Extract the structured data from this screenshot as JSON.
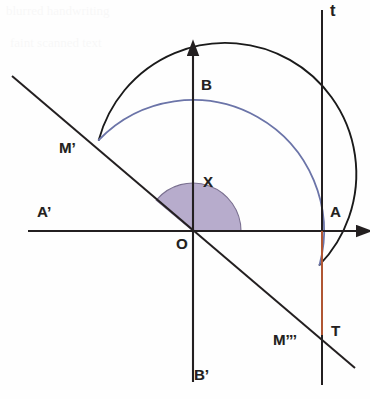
{
  "figure": {
    "kind": "geometry-diagram",
    "width": 370,
    "height": 399,
    "background_color": "#fefefe"
  },
  "colors": {
    "ink": "#231f20",
    "circle_lower_arc": "#1a1a1a",
    "circle_upper_arc": "#6b74a8",
    "angle_fill": "#b3a8c9",
    "angle_stroke": "#7a7090",
    "tangent_segment": "#e06a3a",
    "axis": "#231f20"
  },
  "geometry": {
    "origin": {
      "x": 193,
      "y": 231,
      "label": "O"
    },
    "circle": {
      "cx": 193,
      "cy": 231,
      "r": 131
    },
    "x_axis": {
      "x1": 28,
      "y1": 231,
      "x2": 362,
      "y2": 231,
      "arrow": "right"
    },
    "y_axis": {
      "x1": 193,
      "y1": 382,
      "x2": 193,
      "y2": 50,
      "arrow": "up"
    },
    "tangent_line": {
      "x": 322,
      "y1": 10,
      "y2": 385,
      "label": "t"
    },
    "secant_line": {
      "x1": 12,
      "y1": 76,
      "x2": 355,
      "y2": 368
    },
    "tangent_segment": {
      "x": 322,
      "y1": 231,
      "y2": 335
    },
    "angle_sector": {
      "start_deg": 0,
      "end_deg": 140,
      "radius": 48,
      "label": "X"
    }
  },
  "labels": {
    "tangent_line": "t",
    "top": "B",
    "upper_left_intersection": "M’",
    "angle": "X",
    "left": "A’",
    "right": "A",
    "origin": "O",
    "tangent_point": "T",
    "lower_right_intersection": "M’’’",
    "bottom": "B’"
  },
  "scan_artifacts": {
    "line_one": "blurred handwriting",
    "line_two": "faint scanned text"
  },
  "chart_data": {
    "type": "scatter",
    "xlabel": "",
    "ylabel": "",
    "xlim": [
      -1.26,
      1.29
    ],
    "ylim": [
      -1.29,
      1.38
    ],
    "grid": false,
    "legend_position": "none",
    "annotations": [
      {
        "text": "t",
        "role": "tangent-line-name"
      },
      {
        "text": "X",
        "role": "angle-name"
      }
    ],
    "points": [
      {
        "name": "O",
        "x": 0.0,
        "y": 0.0,
        "role": "center"
      },
      {
        "name": "A",
        "x": 1.0,
        "y": 0.0,
        "role": "circle-right"
      },
      {
        "name": "A’",
        "x": -1.0,
        "y": 0.0,
        "role": "circle-left"
      },
      {
        "name": "B",
        "x": 0.0,
        "y": 1.0,
        "role": "circle-top"
      },
      {
        "name": "B’",
        "x": 0.0,
        "y": -1.0,
        "role": "circle-bottom"
      },
      {
        "name": "M’",
        "x": -0.77,
        "y": 0.64,
        "role": "secant-circle-upper-left"
      },
      {
        "name": "M’’’",
        "x": 0.74,
        "y": -0.63,
        "role": "secant-circle-lower-right"
      },
      {
        "name": "T",
        "x": 1.0,
        "y": -0.79,
        "role": "secant-tangent-intersection"
      }
    ],
    "series": [
      {
        "name": "circle",
        "kind": "circle",
        "cx": 0,
        "cy": 0,
        "r": 1
      },
      {
        "name": "secant through O",
        "kind": "line",
        "slope": -0.85,
        "intercept": 0
      },
      {
        "name": "tangent t at A",
        "kind": "vline",
        "x": 1.0
      },
      {
        "name": "tangent segment AT",
        "kind": "segment",
        "x": 1.0,
        "y_from": 0.0,
        "y_to": -0.79
      }
    ],
    "angle_deg": 140
  }
}
